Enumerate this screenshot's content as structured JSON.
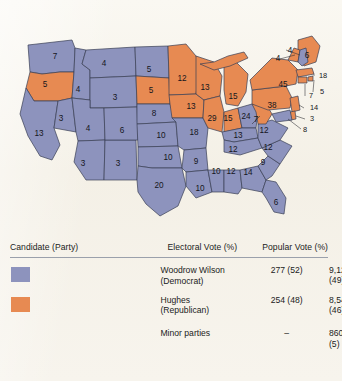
{
  "figure": {
    "colors": {
      "democrat": "#8d93bd",
      "republican": "#e78a52",
      "background": "#f7f4ec",
      "state_border": "#3a3f55",
      "text": "#15161c"
    }
  },
  "map": {
    "states": [
      {
        "name": "Washington",
        "abbr": "WA",
        "electoral_votes": 7,
        "party": "democrat",
        "label_x": 55,
        "label_y": 57
      },
      {
        "name": "Oregon",
        "abbr": "OR",
        "electoral_votes": 5,
        "party": "republican",
        "label_x": 45,
        "label_y": 85
      },
      {
        "name": "California",
        "abbr": "CA",
        "electoral_votes": 13,
        "party": "democrat",
        "label_x": 39,
        "label_y": 134
      },
      {
        "name": "Idaho",
        "abbr": "ID",
        "electoral_votes": 4,
        "party": "democrat",
        "label_x": 78,
        "label_y": 90
      },
      {
        "name": "Nevada",
        "abbr": "NV",
        "electoral_votes": 3,
        "party": "democrat",
        "label_x": 61,
        "label_y": 119
      },
      {
        "name": "Montana",
        "abbr": "MT",
        "electoral_votes": 4,
        "party": "democrat",
        "label_x": 104,
        "label_y": 64
      },
      {
        "name": "Wyoming",
        "abbr": "WY",
        "electoral_votes": 3,
        "party": "democrat",
        "label_x": 115,
        "label_y": 98
      },
      {
        "name": "Utah",
        "abbr": "UT",
        "electoral_votes": 4,
        "party": "democrat",
        "label_x": 88,
        "label_y": 129
      },
      {
        "name": "Arizona",
        "abbr": "AZ",
        "electoral_votes": 3,
        "party": "democrat",
        "label_x": 83,
        "label_y": 164
      },
      {
        "name": "New Mexico",
        "abbr": "NM",
        "electoral_votes": 3,
        "party": "democrat",
        "label_x": 118,
        "label_y": 164
      },
      {
        "name": "Colorado",
        "abbr": "CO",
        "electoral_votes": 6,
        "party": "democrat",
        "label_x": 122,
        "label_y": 131
      },
      {
        "name": "North Dakota",
        "abbr": "ND",
        "electoral_votes": 5,
        "party": "democrat",
        "label_x": 149,
        "label_y": 70
      },
      {
        "name": "South Dakota",
        "abbr": "SD",
        "electoral_votes": 5,
        "party": "republican",
        "label_x": 151,
        "label_y": 91
      },
      {
        "name": "Nebraska",
        "abbr": "NE",
        "electoral_votes": 8,
        "party": "democrat",
        "label_x": 154,
        "label_y": 114
      },
      {
        "name": "Kansas",
        "abbr": "KS",
        "electoral_votes": 10,
        "party": "democrat",
        "label_x": 161,
        "label_y": 136
      },
      {
        "name": "Oklahoma",
        "abbr": "OK",
        "electoral_votes": 10,
        "party": "democrat",
        "label_x": 168,
        "label_y": 158
      },
      {
        "name": "Texas",
        "abbr": "TX",
        "electoral_votes": 20,
        "party": "democrat",
        "label_x": 159,
        "label_y": 186
      },
      {
        "name": "Minnesota",
        "abbr": "MN",
        "electoral_votes": 12,
        "party": "republican",
        "label_x": 182,
        "label_y": 79
      },
      {
        "name": "Iowa",
        "abbr": "IA",
        "electoral_votes": 13,
        "party": "republican",
        "label_x": 191,
        "label_y": 107
      },
      {
        "name": "Missouri",
        "abbr": "MO",
        "electoral_votes": 18,
        "party": "democrat",
        "label_x": 194,
        "label_y": 133
      },
      {
        "name": "Arkansas",
        "abbr": "AR",
        "electoral_votes": 9,
        "party": "democrat",
        "label_x": 196,
        "label_y": 162
      },
      {
        "name": "Louisiana",
        "abbr": "LA",
        "electoral_votes": 10,
        "party": "democrat",
        "label_x": 200,
        "label_y": 189
      },
      {
        "name": "Wisconsin",
        "abbr": "WI",
        "electoral_votes": 13,
        "party": "republican",
        "label_x": 205,
        "label_y": 88
      },
      {
        "name": "Illinois",
        "abbr": "IL",
        "electoral_votes": 29,
        "party": "republican",
        "label_x": 212,
        "label_y": 119
      },
      {
        "name": "Mississippi",
        "abbr": "MS",
        "electoral_votes": 10,
        "party": "democrat",
        "label_x": 216,
        "label_y": 172
      },
      {
        "name": "Michigan",
        "abbr": "MI",
        "electoral_votes": 15,
        "party": "republican",
        "label_x": 233,
        "label_y": 97
      },
      {
        "name": "Indiana",
        "abbr": "IN",
        "electoral_votes": 15,
        "party": "republican",
        "label_x": 228,
        "label_y": 119
      },
      {
        "name": "Alabama",
        "abbr": "AL",
        "electoral_votes": 12,
        "party": "democrat",
        "label_x": 231,
        "label_y": 172
      },
      {
        "name": "Ohio",
        "abbr": "OH",
        "electoral_votes": 24,
        "party": "democrat",
        "label_x": 246,
        "label_y": 117
      },
      {
        "name": "Kentucky",
        "abbr": "KY",
        "electoral_votes": 13,
        "party": "democrat",
        "label_x": 238,
        "label_y": 136
      },
      {
        "name": "Tennessee",
        "abbr": "TN",
        "electoral_votes": 12,
        "party": "democrat",
        "label_x": 233,
        "label_y": 150
      },
      {
        "name": "Georgia",
        "abbr": "GA",
        "electoral_votes": 14,
        "party": "democrat",
        "label_x": 248,
        "label_y": 173
      },
      {
        "name": "Florida",
        "abbr": "FL",
        "electoral_votes": 6,
        "party": "democrat",
        "label_x": 276,
        "label_y": 203
      },
      {
        "name": "South Carolina",
        "abbr": "SC",
        "electoral_votes": 9,
        "party": "democrat",
        "label_x": 263,
        "label_y": 163
      },
      {
        "name": "North Carolina",
        "abbr": "NC",
        "electoral_votes": 12,
        "party": "democrat",
        "label_x": 268,
        "label_y": 148
      },
      {
        "name": "Virginia",
        "abbr": "VA",
        "electoral_votes": 12,
        "party": "democrat",
        "label_x": 264,
        "label_y": 131
      },
      {
        "name": "West Virginia",
        "abbr": "WV",
        "electoral_votes": 7,
        "party": "republican",
        "label_x": 256,
        "label_y": 120
      },
      {
        "name": "Pennsylvania",
        "abbr": "PA",
        "electoral_votes": 38,
        "party": "republican",
        "label_x": 272,
        "label_y": 106
      },
      {
        "name": "New York",
        "abbr": "NY",
        "electoral_votes": 45,
        "party": "republican",
        "label_x": 283,
        "label_y": 85
      },
      {
        "name": "Maine",
        "abbr": "ME",
        "electoral_votes": 6,
        "party": "republican",
        "label_x": 307,
        "label_y": 56
      },
      {
        "name": "Vermont",
        "abbr": "VT",
        "electoral_votes": 4,
        "party": "republican",
        "label_x": 278,
        "label_y": 59
      },
      {
        "name": "New Hampshire",
        "abbr": "NH",
        "electoral_votes": 4,
        "party": "democrat",
        "label_x": 290,
        "label_y": 51
      }
    ],
    "leader_labels": [
      {
        "name": "Massachusetts",
        "abbr": "MA",
        "electoral_votes": 18,
        "party": "republican",
        "label_x": 323,
        "label_y": 76
      },
      {
        "name": "Rhode Island",
        "abbr": "RI",
        "electoral_votes": 5,
        "party": "republican",
        "label_x": 322,
        "label_y": 92
      },
      {
        "name": "Connecticut",
        "abbr": "CT",
        "electoral_votes": 7,
        "party": "republican",
        "label_x": 311,
        "label_y": 96
      },
      {
        "name": "New Jersey",
        "abbr": "NJ",
        "electoral_votes": 14,
        "party": "republican",
        "label_x": 314,
        "label_y": 108
      },
      {
        "name": "Delaware",
        "abbr": "DE",
        "electoral_votes": 3,
        "party": "republican",
        "label_x": 312,
        "label_y": 119
      },
      {
        "name": "Maryland",
        "abbr": "MD",
        "electoral_votes": 8,
        "party": "democrat",
        "label_x": 305,
        "label_y": 130
      }
    ]
  },
  "table": {
    "headers": {
      "candidate": "Candidate (Party)",
      "electoral": "Electoral Vote (%)",
      "popular": "Popular Vote (%)"
    },
    "rows": [
      {
        "swatch_color": "#8d93bd",
        "candidate": "Woodrow Wilson",
        "party": "(Democrat)",
        "electoral": "277 (52)",
        "popular_votes": "9,126,300",
        "popular_pct": "(49)"
      },
      {
        "swatch_color": "#e78a52",
        "candidate": "Hughes",
        "party": "(Republican)",
        "electoral": "254 (48)",
        "popular_votes": "8,546,789",
        "popular_pct": "(46)"
      },
      {
        "swatch_color": "",
        "candidate": "Minor parties",
        "party": "",
        "electoral": "–",
        "popular_votes": "860,916",
        "popular_pct": "(5)"
      }
    ]
  },
  "chart_data": {
    "type": "map",
    "legend": [
      "Woodrow Wilson (Democrat)",
      "Hughes (Republican)"
    ],
    "categories": [
      "Washington",
      "Oregon",
      "California",
      "Idaho",
      "Nevada",
      "Montana",
      "Wyoming",
      "Utah",
      "Arizona",
      "New Mexico",
      "Colorado",
      "North Dakota",
      "South Dakota",
      "Nebraska",
      "Kansas",
      "Oklahoma",
      "Texas",
      "Minnesota",
      "Iowa",
      "Missouri",
      "Arkansas",
      "Louisiana",
      "Wisconsin",
      "Illinois",
      "Mississippi",
      "Michigan",
      "Indiana",
      "Alabama",
      "Ohio",
      "Kentucky",
      "Tennessee",
      "Georgia",
      "Florida",
      "South Carolina",
      "North Carolina",
      "Virginia",
      "West Virginia",
      "Pennsylvania",
      "New York",
      "Maine",
      "Vermont",
      "New Hampshire",
      "Massachusetts",
      "Rhode Island",
      "Connecticut",
      "New Jersey",
      "Delaware",
      "Maryland"
    ],
    "values": [
      7,
      5,
      13,
      4,
      3,
      4,
      3,
      4,
      3,
      3,
      6,
      5,
      5,
      8,
      10,
      10,
      20,
      12,
      13,
      18,
      9,
      10,
      13,
      29,
      10,
      15,
      15,
      12,
      24,
      13,
      12,
      14,
      6,
      9,
      12,
      12,
      7,
      38,
      45,
      6,
      4,
      4,
      18,
      5,
      7,
      14,
      3,
      8
    ],
    "series": [
      {
        "name": "Woodrow Wilson (Democrat)",
        "electoral_total": 277,
        "electoral_pct": 52,
        "popular_votes": 9126300,
        "popular_pct": 49
      },
      {
        "name": "Hughes (Republican)",
        "electoral_total": 254,
        "electoral_pct": 48,
        "popular_votes": 8546789,
        "popular_pct": 46
      },
      {
        "name": "Minor parties",
        "electoral_total": null,
        "electoral_pct": null,
        "popular_votes": 860916,
        "popular_pct": 5
      }
    ]
  }
}
